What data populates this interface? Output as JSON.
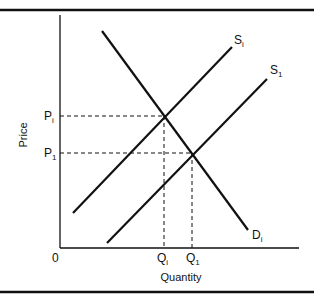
{
  "diagram": {
    "type": "supply-demand",
    "axes": {
      "x_label": "Quantity",
      "y_label": "Price",
      "origin_label": "0"
    },
    "curves": {
      "demand": {
        "main": "D",
        "sub": "i"
      },
      "supply_initial": {
        "main": "S",
        "sub": "i"
      },
      "supply_new": {
        "main": "S",
        "sub": "1"
      }
    },
    "prices": {
      "p_initial": {
        "main": "P",
        "sub": "i"
      },
      "p_new": {
        "main": "P",
        "sub": "1"
      }
    },
    "quantities": {
      "q_initial": {
        "main": "Q",
        "sub": "i"
      },
      "q_new": {
        "main": "Q",
        "sub": "1"
      }
    },
    "equilibria": [
      {
        "name": "initial",
        "price": "P_i",
        "quantity": "Q_i",
        "curves": [
          "S_i",
          "D_i"
        ]
      },
      {
        "name": "new",
        "price": "P_1",
        "quantity": "Q_1",
        "curves": [
          "S_1",
          "D_i"
        ]
      }
    ],
    "colors": {
      "line": "#111111",
      "background": "#ffffff"
    }
  }
}
